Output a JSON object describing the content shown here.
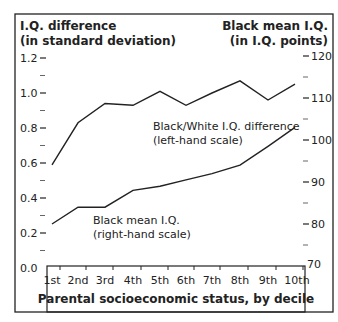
{
  "chart_data": {
    "type": "line",
    "left_axis_title": [
      "I.Q. difference",
      "(in standard deviation)"
    ],
    "right_axis_title": [
      "Black mean I.Q.",
      "(in I.Q. points)"
    ],
    "xlabel": "Parental socioeconomic status, by decile",
    "categories": [
      "1st",
      "2nd",
      "3rd",
      "4th",
      "5th",
      "6th",
      "7th",
      "8th",
      "9th",
      "10th"
    ],
    "left_ticks": [
      "0.0",
      "0.2",
      "0.4",
      "0.6",
      "0.8",
      "1.0",
      "1.2"
    ],
    "right_ticks": [
      "70",
      "80",
      "90",
      "100",
      "110",
      "120"
    ],
    "left_ylim": [
      0,
      1.2
    ],
    "right_ylim": [
      70,
      120
    ],
    "series": [
      {
        "name": "Black/White I.Q. difference",
        "label_lines": [
          "Black/White I.Q. difference",
          "(left-hand scale)"
        ],
        "axis": "left",
        "values": [
          0.59,
          0.83,
          0.94,
          0.93,
          1.01,
          0.93,
          1.0,
          1.07,
          0.96,
          1.05
        ]
      },
      {
        "name": "Black mean I.Q.",
        "label_lines": [
          "Black mean I.Q.",
          "(right-hand scale)"
        ],
        "axis": "right",
        "values": [
          80,
          84,
          84,
          88,
          89,
          90.5,
          92,
          94,
          98.5,
          103
        ]
      }
    ],
    "grid": false,
    "legend": "inline labels"
  }
}
